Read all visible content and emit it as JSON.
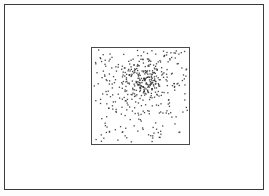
{
  "figure": {
    "title": "",
    "width": 269,
    "height": 196,
    "background_color": "#fdfdfd"
  },
  "outer_frame": {
    "name": "outer-frame",
    "x": 4,
    "y": 4,
    "width": 260,
    "height": 186,
    "border_color": "#3a3a3c",
    "border_width": 1,
    "fill_color": "#ffffff"
  },
  "plot_box": {
    "name": "plot-box",
    "x": 86,
    "y": 42,
    "width": 99,
    "height": 98,
    "border_color": "#4a4a4c",
    "border_width": 1,
    "fill_color": "#ffffff"
  },
  "chart_data": {
    "type": "scatter",
    "title": "",
    "xlabel": "",
    "ylabel": "",
    "xlim": [
      0,
      1
    ],
    "ylim": [
      0,
      1
    ],
    "grid": false,
    "legend": null,
    "tick_labels_x": [],
    "tick_labels_y": [],
    "annotations": [],
    "marker": {
      "shape": "square",
      "size_px": 1.3,
      "color": "#2e2e30",
      "opacity": 0.88
    },
    "series": [
      {
        "name": "uniform-background",
        "distribution": "uniform",
        "count": 210,
        "x_range": [
          0.015,
          0.985
        ],
        "y_range": [
          0.015,
          0.985
        ],
        "seed": 20947
      },
      {
        "name": "gaussian-cluster",
        "distribution": "gaussian",
        "count": 245,
        "center_x": 0.545,
        "center_y": 0.655,
        "sigma_x": 0.125,
        "sigma_y": 0.125,
        "seed": 81533
      }
    ]
  }
}
